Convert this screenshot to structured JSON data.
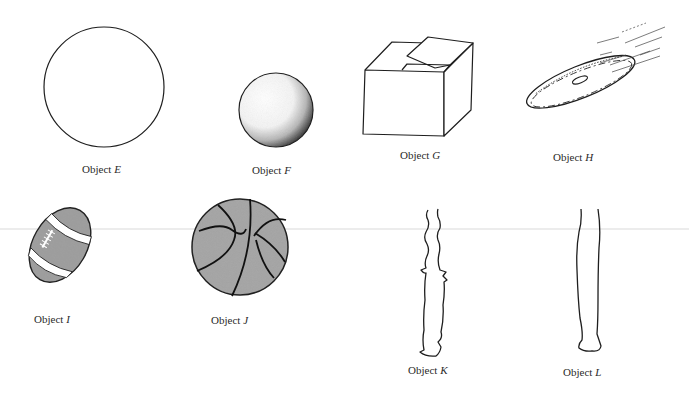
{
  "figure": {
    "colors": {
      "ink": "#1e1e1e",
      "fill_gray": "#9a9a9a",
      "background": "#ffffff"
    },
    "objects": [
      {
        "id": "E",
        "prefix": "Object",
        "letter": "E",
        "depiction": "plain circle"
      },
      {
        "id": "F",
        "prefix": "Object",
        "letter": "F",
        "depiction": "shaded sphere"
      },
      {
        "id": "G",
        "prefix": "Object",
        "letter": "G",
        "depiction": "cardboard box"
      },
      {
        "id": "H",
        "prefix": "Object",
        "letter": "H",
        "depiction": "flying disc"
      },
      {
        "id": "I",
        "prefix": "Object",
        "letter": "I",
        "depiction": "football"
      },
      {
        "id": "J",
        "prefix": "Object",
        "letter": "J",
        "depiction": "basketball"
      },
      {
        "id": "K",
        "prefix": "Object",
        "letter": "K",
        "depiction": "irregular stick"
      },
      {
        "id": "L",
        "prefix": "Object",
        "letter": "L",
        "depiction": "smooth stick"
      }
    ]
  }
}
